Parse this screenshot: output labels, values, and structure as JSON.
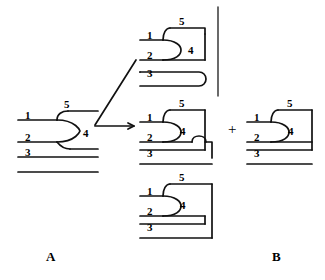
{
  "figure": {
    "caption_letters": {
      "left": "A",
      "right": "B"
    },
    "operator": "+",
    "arrows": [
      {
        "name": "diagonal-arrow",
        "label": ""
      },
      {
        "name": "horizontal-arrow",
        "label": ""
      }
    ],
    "panels": [
      {
        "id": "panel-a",
        "letter": "A",
        "strand_labels": [
          "1",
          "2",
          "3"
        ],
        "cap_label": "5",
        "region_label": "4"
      },
      {
        "id": "panel-top",
        "letter": "",
        "strand_labels": [
          "1",
          "2",
          "3"
        ],
        "cap_label": "5",
        "region_label": "4"
      },
      {
        "id": "panel-middle",
        "letter": "",
        "strand_labels": [
          "1",
          "2",
          "3"
        ],
        "cap_label": "5",
        "region_label": "4"
      },
      {
        "id": "panel-bottom",
        "letter": "",
        "strand_labels": [
          "1",
          "2",
          "3"
        ],
        "cap_label": "5",
        "region_label": "4"
      },
      {
        "id": "panel-b",
        "letter": "B",
        "strand_labels": [
          "1",
          "2",
          "3"
        ],
        "cap_label": "5",
        "region_label": "4"
      }
    ],
    "colors": {
      "ink": "#111111",
      "background": "#ffffff"
    }
  }
}
